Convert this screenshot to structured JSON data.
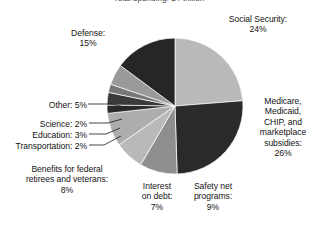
{
  "chart": {
    "title": "Total spending: $4 trillion"
  },
  "chart_data": {
    "type": "pie",
    "title": "Total spending: $4 trillion",
    "xlabel": "",
    "ylabel": "",
    "legend": "none",
    "grid": false,
    "units": "percent",
    "start_angle_deg": 0,
    "direction": "clockwise",
    "categories": [
      "Social Security",
      "Medicare, Medicaid, CHIP, and marketplace subsidies",
      "Safety net programs",
      "Interest on debt",
      "Benefits for federal retirees and veterans",
      "Transportation",
      "Education",
      "Science",
      "Other",
      "Defense"
    ],
    "values": [
      24,
      26,
      9,
      7,
      8,
      2,
      3,
      2,
      5,
      15
    ],
    "colors": [
      "#b9b9b9",
      "#2a2a2a",
      "#8e8e8e",
      "#b9b9b9",
      "#adadad",
      "#2a2a2a",
      "#3a3a3a",
      "#777777",
      "#9a9a9a",
      "#262626"
    ],
    "slices": [
      {
        "label": "Social Security",
        "value": 24,
        "color": "#b9b9b9"
      },
      {
        "label": "Medicare, Medicaid, CHIP, and marketplace subsidies",
        "value": 26,
        "color": "#2a2a2a"
      },
      {
        "label": "Safety net programs",
        "value": 9,
        "color": "#8e8e8e"
      },
      {
        "label": "Interest on debt",
        "value": 7,
        "color": "#b9b9b9"
      },
      {
        "label": "Benefits for federal retirees and veterans",
        "value": 8,
        "color": "#adadad"
      },
      {
        "label": "Transportation",
        "value": 2,
        "color": "#2a2a2a"
      },
      {
        "label": "Education",
        "value": 3,
        "color": "#3a3a3a"
      },
      {
        "label": "Science",
        "value": 2,
        "color": "#777777"
      },
      {
        "label": "Other",
        "value": 5,
        "color": "#9a9a9a"
      },
      {
        "label": "Defense",
        "value": 15,
        "color": "#262626"
      }
    ]
  },
  "labels": {
    "social_security": "Social Security:\n24%",
    "medicare": "Medicare,\nMedicaid,\nCHIP, and\nmarketplace\nsubsidies:\n26%",
    "defense": "Defense:\n15%",
    "other": "Other: 5%",
    "science": "Science: 2%",
    "education": "Education: 3%",
    "transportation": "Transportation: 2%",
    "benefits": "Benefits for federal\nretirees and veterans:\n8%",
    "interest": "Interest\non debt:\n7%",
    "safety_net": "Safety net\nprograms:\n9%"
  }
}
